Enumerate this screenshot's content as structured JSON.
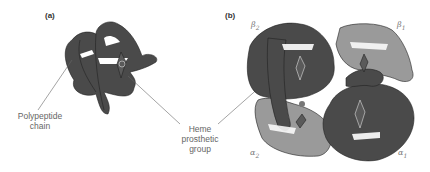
{
  "figure": {
    "panel_a": {
      "label": "(a)",
      "callout_polypeptide_line1": "Polypeptide",
      "callout_polypeptide_line2": "chain",
      "callout_heme_line1": "Heme",
      "callout_heme_line2": "prosthetic",
      "callout_heme_line3": "group"
    },
    "panel_b": {
      "label": "(b)",
      "subunits": [
        {
          "symbol": "β",
          "index": "2",
          "shade": "dark"
        },
        {
          "symbol": "β",
          "index": "1",
          "shade": "light"
        },
        {
          "symbol": "α",
          "index": "2",
          "shade": "light"
        },
        {
          "symbol": "α",
          "index": "1",
          "shade": "dark"
        }
      ]
    },
    "colors": {
      "dark_chain": "#4a4a4a",
      "light_chain": "#9a9a9a",
      "outline": "#222222",
      "leader_line": "#666666"
    }
  }
}
